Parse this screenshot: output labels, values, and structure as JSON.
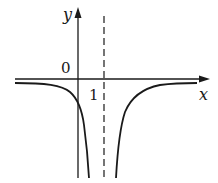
{
  "diagram": {
    "type": "function-graph",
    "axes": {
      "x_label": "x",
      "y_label": "y",
      "origin_label": "0",
      "tick_label": "1"
    },
    "asymptote": {
      "vertical_at": 1,
      "style": "dashed"
    },
    "curves": [
      {
        "branch": "left",
        "description": "approaches x-axis from below as x→-∞, crosses y-axis below origin, goes to -∞ as x→1⁻"
      },
      {
        "branch": "right",
        "description": "goes to -∞ as x→1⁺, approaches x-axis from below as x→+∞"
      }
    ],
    "colors": {
      "stroke": "#1a1a1a",
      "background": "#ffffff"
    }
  }
}
